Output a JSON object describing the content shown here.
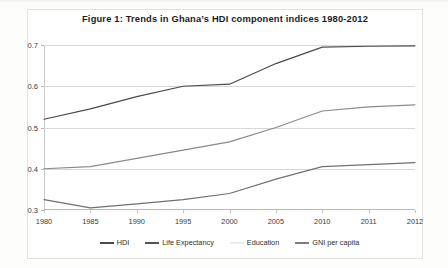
{
  "figure": {
    "title": "Figure 1: Trends in Ghana’s HDI component indices 1980-2012"
  },
  "chart_data": {
    "type": "line",
    "title": "Figure 1: Trends in Ghana’s HDI component indices 1980-2012",
    "xlabel": "",
    "ylabel": "",
    "x": [
      "1980",
      "1985",
      "1990",
      "1995",
      "2000",
      "2005",
      "2010",
      "2011",
      "2012"
    ],
    "categories": [
      "1980",
      "1985",
      "1990",
      "1995",
      "2000",
      "2005",
      "2010",
      "2011",
      "2012"
    ],
    "ylim": [
      0.3,
      0.7
    ],
    "yticks": [
      "0.3",
      "0.4",
      "0.5",
      "0.6",
      "0.7"
    ],
    "ytick_values": [
      0.3,
      0.4,
      0.5,
      0.6,
      0.7
    ],
    "grid": true,
    "legend_position": "bottom",
    "series": [
      {
        "name": "HDI",
        "color": "#4a4a4a",
        "values": [
          0.52,
          0.545,
          0.575,
          0.6,
          0.605,
          0.655,
          0.695,
          0.697,
          0.698
        ]
      },
      {
        "name": "Life Expectancy",
        "color": "#8a8a8a",
        "values": [
          0.4,
          0.405,
          0.425,
          0.445,
          0.465,
          0.5,
          0.54,
          0.55,
          0.555
        ]
      },
      {
        "name": "Education",
        "color": "#e0e0e0",
        "values": [
          null,
          null,
          null,
          null,
          null,
          null,
          null,
          null,
          null
        ]
      },
      {
        "name": "GNI per capita",
        "color": "#707070",
        "values": [
          0.325,
          0.305,
          0.315,
          0.325,
          0.34,
          0.375,
          0.405,
          0.41,
          0.415
        ]
      }
    ]
  },
  "legend": {
    "items": [
      {
        "label": "HDI",
        "color": "#4a4a4a"
      },
      {
        "label": "Life Expectancy",
        "color": "#555555"
      },
      {
        "label": "Education",
        "color": "#ededed"
      },
      {
        "label": "GNI per capita",
        "color": "#7d7d7d"
      }
    ]
  }
}
